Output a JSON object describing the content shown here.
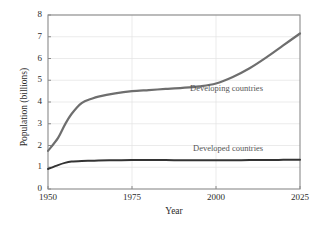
{
  "chart_data": {
    "type": "line",
    "title": "",
    "subtitle": "",
    "xlabel": "Year",
    "ylabel": "Population (billions)",
    "xlim": [
      1950,
      2025
    ],
    "ylim": [
      0,
      8
    ],
    "xticks": [
      1950,
      1975,
      2000,
      2025
    ],
    "yticks": [
      0,
      1,
      2,
      3,
      4,
      5,
      6,
      7,
      8
    ],
    "grid": true,
    "legend_position": "inline-annotation",
    "x": [
      1950,
      1953,
      1955,
      1957,
      1960,
      1963,
      1965,
      1970,
      1975,
      1980,
      1985,
      1990,
      1995,
      2000,
      2005,
      2010,
      2015,
      2020,
      2025
    ],
    "series": [
      {
        "name": "Developing countries",
        "label": "Developing countries",
        "color": "#6e6e6e",
        "values": [
          1.75,
          2.35,
          2.95,
          3.45,
          3.95,
          4.15,
          4.25,
          4.4,
          4.5,
          4.55,
          4.6,
          4.65,
          4.72,
          4.85,
          5.15,
          5.55,
          6.05,
          6.6,
          7.15
        ]
      },
      {
        "name": "Developed countries",
        "label": "Developed countries",
        "color": "#333333",
        "values": [
          0.92,
          1.1,
          1.2,
          1.26,
          1.29,
          1.3,
          1.31,
          1.32,
          1.33,
          1.33,
          1.33,
          1.32,
          1.32,
          1.32,
          1.32,
          1.33,
          1.33,
          1.34,
          1.35
        ]
      }
    ],
    "annotations": [
      {
        "text": "Developing countries",
        "x": 2006,
        "y": 4.45
      },
      {
        "text": "Developed countries",
        "x": 2007,
        "y": 1.85
      }
    ]
  },
  "axis": {
    "y_tick_labels": [
      "8",
      "7",
      "6",
      "5",
      "4",
      "3",
      "2",
      "1",
      "0"
    ],
    "x_tick_labels": [
      "1950",
      "1975",
      "2000",
      "2025"
    ],
    "y_title": "Population (billions)",
    "x_title": "Year"
  },
  "colors": {
    "frame": "#8a8a8a",
    "grid": "#e2e2e2",
    "developing": "#6e6e6e",
    "developed": "#333333",
    "text": "#2b2b2b",
    "annotation_text": "#555555",
    "background": "#ffffff"
  }
}
